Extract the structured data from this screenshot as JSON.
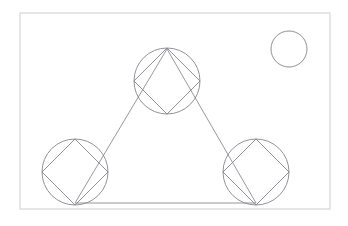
{
  "figure": {
    "title": "Geometric line drawing",
    "background_color": "#ffffff",
    "canvas": {
      "width": 348,
      "height": 226
    }
  },
  "colors": {
    "frame_stroke": "#d2d2d4",
    "shape_stroke": "#84848c",
    "triangle_stroke": "#8b8b92",
    "fill": "none"
  },
  "chart_data": {
    "type": "diagram",
    "title": "Geometric line drawing",
    "frame": {
      "name": "outer-frame",
      "x": 20,
      "y": 13,
      "width": 310,
      "height": 196,
      "stroke": "#d2d2d4",
      "stroke_width": 1.1
    },
    "triangle": {
      "name": "connecting-triangle",
      "points": [
        {
          "label": "apex",
          "x": 167,
          "y": 49
        },
        {
          "label": "bottom-right",
          "x": 256,
          "y": 203
        },
        {
          "label": "bottom-left",
          "x": 75,
          "y": 203
        }
      ],
      "closed": true,
      "stroke": "#8b8b92",
      "stroke_width": 0.9
    },
    "circles": [
      {
        "name": "top-circle",
        "cx": 167,
        "cy": 81,
        "r": 33,
        "has_inscribed_square": true,
        "stroke": "#84848c",
        "stroke_width": 0.9
      },
      {
        "name": "bottom-left-circle",
        "cx": 75,
        "cy": 172,
        "r": 33,
        "has_inscribed_square": true,
        "stroke": "#84848c",
        "stroke_width": 0.9
      },
      {
        "name": "bottom-right-circle",
        "cx": 256,
        "cy": 172,
        "r": 33,
        "has_inscribed_square": true,
        "stroke": "#84848c",
        "stroke_width": 0.9
      },
      {
        "name": "corner-circle",
        "cx": 289,
        "cy": 49,
        "r": 18,
        "has_inscribed_square": false,
        "stroke": "#84848c",
        "stroke_width": 0.9
      }
    ],
    "inscribed_squares": [
      {
        "name": "top-inscribed-square",
        "circle": "top-circle",
        "rotation_deg": 45,
        "points": [
          {
            "x": 167,
            "y": 48
          },
          {
            "x": 200,
            "y": 81
          },
          {
            "x": 167,
            "y": 114
          },
          {
            "x": 134,
            "y": 81
          }
        ]
      },
      {
        "name": "bottom-left-inscribed-square",
        "circle": "bottom-left-circle",
        "rotation_deg": 45,
        "points": [
          {
            "x": 75,
            "y": 139
          },
          {
            "x": 108,
            "y": 172
          },
          {
            "x": 75,
            "y": 205
          },
          {
            "x": 42,
            "y": 172
          }
        ]
      },
      {
        "name": "bottom-right-inscribed-square",
        "circle": "bottom-right-circle",
        "rotation_deg": 45,
        "points": [
          {
            "x": 256,
            "y": 139
          },
          {
            "x": 289,
            "y": 172
          },
          {
            "x": 256,
            "y": 205
          },
          {
            "x": 223,
            "y": 172
          }
        ]
      }
    ],
    "counts": {
      "circles": 4,
      "inscribed_squares": 3,
      "triangles": 1,
      "rectangles": 1
    }
  }
}
